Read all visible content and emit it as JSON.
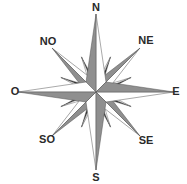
{
  "compass": {
    "center": [
      96,
      92
    ],
    "colors": {
      "light": "#ffffff",
      "mid": "#8f8f8f",
      "dark": "#3a3a3a",
      "stroke": "#555555"
    },
    "labels": {
      "n": {
        "text": "N",
        "x": 96,
        "y": 11
      },
      "ne": {
        "text": "NE",
        "x": 146,
        "y": 44
      },
      "e": {
        "text": "E",
        "x": 176,
        "y": 95
      },
      "se": {
        "text": "SE",
        "x": 146,
        "y": 144
      },
      "s": {
        "text": "S",
        "x": 96,
        "y": 181
      },
      "so": {
        "text": "SO",
        "x": 47,
        "y": 143
      },
      "o": {
        "text": "O",
        "x": 15,
        "y": 95
      },
      "no": {
        "text": "NO",
        "x": 48,
        "y": 45
      }
    }
  }
}
